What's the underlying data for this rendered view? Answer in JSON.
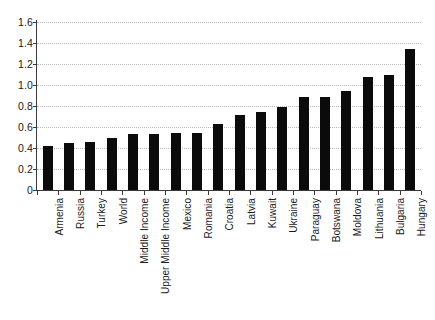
{
  "chart_data": {
    "type": "bar",
    "title": "",
    "subtitle": "",
    "xlabel": "",
    "ylabel": "",
    "ylim": [
      0,
      1.6
    ],
    "yticks": [
      0,
      0.2,
      0.4,
      0.6,
      0.8,
      1.0,
      1.2,
      1.4,
      1.6
    ],
    "ytick_labels": [
      "0",
      "0.2",
      "0.4",
      "0.6",
      "0.8",
      "1.0",
      "1.2",
      "1.4",
      "1.6"
    ],
    "grid": true,
    "grid_axis": "y",
    "legend": false,
    "legend_position": "none",
    "bar_color": "#0b0b0b",
    "background_color": "#ffffff",
    "gridline_color": "#b9b9b9",
    "axis_color": "#3a3a3a",
    "categories": [
      "Armenia",
      "Russia",
      "Turkey",
      "World",
      "Middle Income",
      "Upper Middle Income",
      "Mexico",
      "Romania",
      "Croatia",
      "Latvia",
      "Kuwait",
      "Ukraine",
      "Paraguay",
      "Botswana",
      "Moldova",
      "Lithuania",
      "Bulgaria",
      "Hungary"
    ],
    "values": [
      0.42,
      0.45,
      0.46,
      0.5,
      0.53,
      0.53,
      0.54,
      0.545,
      0.63,
      0.715,
      0.74,
      0.79,
      0.885,
      0.885,
      0.94,
      1.08,
      1.1,
      1.34
    ]
  }
}
